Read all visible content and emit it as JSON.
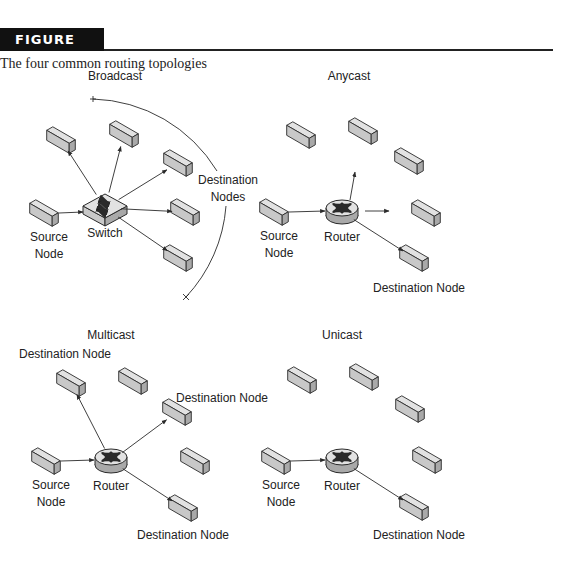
{
  "figure": {
    "label": "FIGURE 3.7",
    "caption": "The four common routing topologies"
  },
  "panels": [
    {
      "id": "broadcast",
      "title": "Broadcast",
      "title_pos": [
        115,
        80
      ],
      "hub": {
        "type": "switch",
        "label": "Switch",
        "x": 105,
        "y": 208
      },
      "source": {
        "label": [
          "Source",
          "Node"
        ],
        "x": 44,
        "y": 213
      },
      "nodes": [
        {
          "x": 61,
          "y": 140,
          "dest": true
        },
        {
          "x": 124,
          "y": 134,
          "dest": true
        },
        {
          "x": 178,
          "y": 163,
          "dest": true
        },
        {
          "x": 185,
          "y": 212,
          "dest": true
        },
        {
          "x": 178,
          "y": 258,
          "dest": true
        }
      ],
      "labels": [
        {
          "text": "Destination",
          "x": 228,
          "y": 184
        },
        {
          "text": "Nodes",
          "x": 228,
          "y": 201
        }
      ],
      "arc": true
    },
    {
      "id": "anycast",
      "title": "Anycast",
      "title_pos": [
        349,
        80
      ],
      "hub": {
        "type": "router",
        "label": "Router",
        "x": 342,
        "y": 212
      },
      "source": {
        "label": [
          "Source",
          "Node"
        ],
        "x": 274,
        "y": 212
      },
      "nodes": [
        {
          "x": 301,
          "y": 135,
          "dest": false
        },
        {
          "x": 363,
          "y": 131,
          "dest": false
        },
        {
          "x": 409,
          "y": 161,
          "dest": false
        },
        {
          "x": 426,
          "y": 213,
          "dest": false
        },
        {
          "x": 414,
          "y": 258,
          "dest": true
        }
      ],
      "stubs": [
        [
          350,
          200,
          355,
          172
        ],
        [
          365,
          211,
          389,
          211
        ]
      ],
      "labels": [
        {
          "text": "Destination Node",
          "x": 419,
          "y": 292
        }
      ]
    },
    {
      "id": "multicast",
      "title": "Multicast",
      "title_pos": [
        111,
        339
      ],
      "hub": {
        "type": "router",
        "label": "Router",
        "x": 111,
        "y": 461
      },
      "source": {
        "label": [
          "Source",
          "Node"
        ],
        "x": 46,
        "y": 461
      },
      "nodes": [
        {
          "x": 71,
          "y": 383,
          "dest": true
        },
        {
          "x": 133,
          "y": 381,
          "dest": false
        },
        {
          "x": 177,
          "y": 412,
          "dest": true
        },
        {
          "x": 195,
          "y": 461,
          "dest": false
        },
        {
          "x": 183,
          "y": 508,
          "dest": true
        }
      ],
      "labels": [
        {
          "text": "Destination Node",
          "x": 65,
          "y": 358
        },
        {
          "text": "Destination Node",
          "x": 222,
          "y": 402
        },
        {
          "text": "Destination Node",
          "x": 183,
          "y": 539
        }
      ]
    },
    {
      "id": "unicast",
      "title": "Unicast",
      "title_pos": [
        342,
        339
      ],
      "hub": {
        "type": "router",
        "label": "Router",
        "x": 342,
        "y": 461
      },
      "source": {
        "label": [
          "Source",
          "Node"
        ],
        "x": 276,
        "y": 461
      },
      "nodes": [
        {
          "x": 302,
          "y": 380,
          "dest": false
        },
        {
          "x": 364,
          "y": 377,
          "dest": false
        },
        {
          "x": 410,
          "y": 409,
          "dest": false
        },
        {
          "x": 427,
          "y": 460,
          "dest": false
        },
        {
          "x": 414,
          "y": 507,
          "dest": true
        }
      ],
      "labels": [
        {
          "text": "Destination Node",
          "x": 419,
          "y": 539
        }
      ]
    }
  ],
  "colors": {
    "node_fill": "#c8c8c8",
    "node_top": "#e2e2e2",
    "node_side": "#a9a9a9",
    "stroke": "#2a2a2a"
  }
}
